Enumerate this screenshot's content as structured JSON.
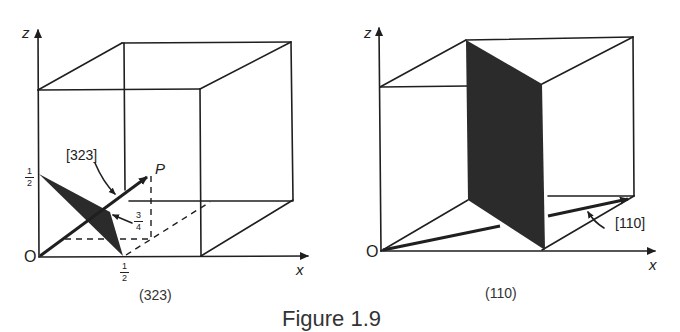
{
  "figure": {
    "caption": "Figure 1.9"
  },
  "left_panel": {
    "subcaption": "(323)",
    "axis_z": "z",
    "axis_x": "x",
    "origin": "O",
    "direction_label": "[323]",
    "point_label": "P",
    "intercept_z": {
      "num": "1",
      "den": "2"
    },
    "intercept_x": {
      "num": "1",
      "den": "2"
    },
    "intercept_y": {
      "num": "3",
      "den": "4"
    }
  },
  "right_panel": {
    "subcaption": "(110)",
    "axis_z": "z",
    "axis_x": "x",
    "origin": "O",
    "direction_label": "[110]"
  },
  "colors": {
    "line": "#1f1f1f",
    "plane_fill": "#2b2b2b",
    "background": "#ffffff"
  }
}
